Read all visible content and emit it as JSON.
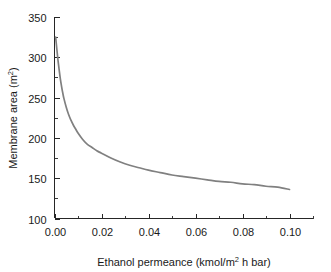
{
  "figure": {
    "background_color": "#ffffff",
    "axis_color": "#262626"
  },
  "chart_data": {
    "type": "line",
    "title": "",
    "subtitle": "",
    "xlabel_parts": {
      "base": "Ethanol permeance (kmol/m",
      "exponent": "2",
      "tail": " h bar)"
    },
    "ylabel_parts": {
      "base": "Membrane area (m",
      "exponent": "2",
      "tail": ")"
    },
    "xlabel": "Ethanol permeance (kmol/m2 h bar)",
    "ylabel": "Membrane area (m2)",
    "xlim": [
      0.0,
      0.11
    ],
    "ylim": [
      100,
      350
    ],
    "xticks": [
      0.0,
      0.02,
      0.04,
      0.06,
      0.08,
      0.1
    ],
    "xtick_labels": [
      "0.00",
      "0.02",
      "0.04",
      "0.06",
      "0.08",
      "0.10"
    ],
    "xticks_minor": [
      0.01,
      0.03,
      0.05,
      0.07,
      0.09,
      0.11
    ],
    "yticks": [
      100,
      150,
      200,
      250,
      300,
      350
    ],
    "ytick_labels": [
      "100",
      "150",
      "200",
      "250",
      "300",
      "350"
    ],
    "yticks_minor": [
      125,
      175,
      225,
      275,
      325
    ],
    "grid": false,
    "legend": "none",
    "series": [
      {
        "name": "Membrane area",
        "color": "#808080",
        "line_width": 1.7,
        "x": [
          0.0005,
          0.001,
          0.0015,
          0.002,
          0.0025,
          0.003,
          0.0035,
          0.004,
          0.005,
          0.006,
          0.007,
          0.008,
          0.009,
          0.01,
          0.012,
          0.014,
          0.016,
          0.018,
          0.02,
          0.024,
          0.028,
          0.032,
          0.036,
          0.04,
          0.045,
          0.05,
          0.055,
          0.06,
          0.065,
          0.07,
          0.075,
          0.08,
          0.085,
          0.09,
          0.095,
          0.1
        ],
        "y": [
          325,
          310,
          296,
          284,
          273,
          264,
          256,
          249,
          238,
          229,
          222,
          216,
          211,
          206,
          198,
          192,
          188,
          184,
          181,
          175,
          170,
          166,
          163,
          160,
          157,
          154,
          152,
          150,
          148,
          146,
          145,
          143,
          142,
          140,
          139,
          136
        ]
      }
    ],
    "annotations": [],
    "notes": {
      "x_start_value": 325,
      "x_end_value": 136,
      "shape": "monotonic decreasing hyperbolic decay"
    }
  }
}
